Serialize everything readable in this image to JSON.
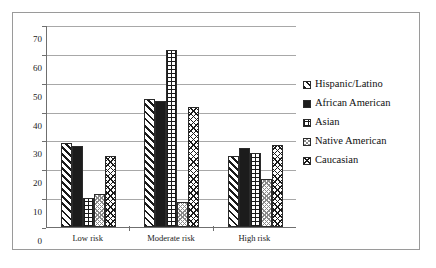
{
  "chart_data": {
    "type": "bar",
    "title": "",
    "subtitle": "",
    "xlabel": "",
    "ylabel": "",
    "categories": [
      "Low risk",
      "Moderate risk",
      "High risk"
    ],
    "series": [
      {
        "name": "Hispanic/Latino",
        "pattern": "diagonal-hatch",
        "values": [
          29,
          44.5,
          24.5
        ]
      },
      {
        "name": "African American",
        "pattern": "solid-black",
        "values": [
          28,
          43.5,
          27.5
        ]
      },
      {
        "name": "Asian",
        "pattern": "grid",
        "values": [
          10,
          61.5,
          25.5
        ]
      },
      {
        "name": "Native American",
        "pattern": "fine-dots",
        "values": [
          11.5,
          8.5,
          16.5
        ]
      },
      {
        "name": "Caucasian",
        "pattern": "cross-hatch",
        "values": [
          24.5,
          41.5,
          28.5
        ]
      }
    ],
    "ylim": [
      0,
      70
    ],
    "yticks": [
      0,
      10,
      20,
      30,
      40,
      50,
      60,
      70
    ],
    "ytick_labels": [
      "0",
      "10",
      "20",
      "30",
      "40",
      "50",
      "60",
      "70"
    ],
    "grid": true,
    "grid_axis": "y",
    "legend_position": "right",
    "colors": {
      "line": "#1a1a1a",
      "gridline": "#a8a8a8",
      "axis": "#6f6f6f",
      "frame": "#9a9a9a",
      "background": "#ffffff",
      "text": "#0f0f0f"
    }
  },
  "legend": {
    "items": [
      {
        "label": "Hispanic/Latino"
      },
      {
        "label": "African American"
      },
      {
        "label": "Asian"
      },
      {
        "label": "Native American"
      },
      {
        "label": "Caucasian"
      }
    ]
  },
  "yaxis": {
    "ticks": [
      "70",
      "60",
      "50",
      "40",
      "30",
      "20",
      "10",
      "0"
    ]
  },
  "xaxis": {
    "ticks": [
      "Low risk",
      "Moderate risk",
      "High risk"
    ]
  }
}
